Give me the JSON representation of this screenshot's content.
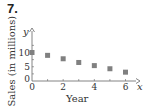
{
  "problem_number": "7.",
  "chart_data": {
    "type": "scatter",
    "title": "",
    "xlabel": "Year",
    "ylabel": "Sales (in millions)",
    "x_axis_var": "x",
    "y_axis_var": "y",
    "x": [
      0,
      1,
      2,
      3,
      4,
      5,
      6
    ],
    "y": [
      10,
      9,
      7.8,
      6.5,
      5.4,
      4.3,
      3.1
    ],
    "x_ticks": [
      "0",
      "2",
      "4",
      "6"
    ],
    "y_ticks": [
      "0",
      "5",
      "10"
    ],
    "xlim": [
      0,
      6.6
    ],
    "ylim": [
      0,
      14
    ],
    "marker": "square",
    "marker_color": "#808080",
    "grid": false,
    "legend": null
  }
}
